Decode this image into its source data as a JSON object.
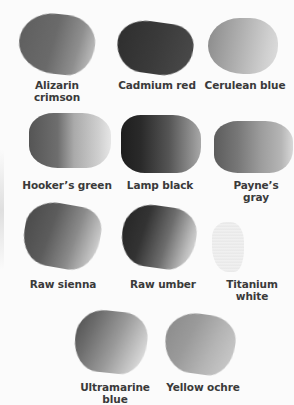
{
  "swatches": [
    {
      "name": "Alizarin crimson",
      "line1": "Alizarin",
      "line2": "crimson"
    },
    {
      "name": "Cadmium red",
      "line1": "Cadmium red"
    },
    {
      "name": "Cerulean blue",
      "line1": "Cerulean blue"
    },
    {
      "name": "Hooker's green",
      "line1": "Hooker’s green"
    },
    {
      "name": "Lamp black",
      "line1": "Lamp black"
    },
    {
      "name": "Payne's gray",
      "line1": "Payne’s gray"
    },
    {
      "name": "Raw sienna",
      "line1": "Raw sienna"
    },
    {
      "name": "Raw umber",
      "line1": "Raw umber"
    },
    {
      "name": "Titanium white",
      "line1": "Titanium white"
    },
    {
      "name": "Ultramarine blue",
      "line1": "Ultramarine",
      "line2": "blue"
    },
    {
      "name": "Yellow ochre",
      "line1": "Yellow ochre"
    }
  ]
}
